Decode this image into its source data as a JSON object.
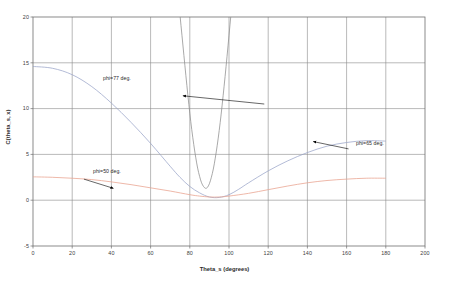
{
  "chart_data": {
    "type": "line",
    "title": "",
    "xlabel": "Theta_s (degrees)",
    "ylabel": "C(theta_s, x)",
    "xlim": [
      0,
      200
    ],
    "ylim": [
      -5,
      20
    ],
    "xticks": [
      0,
      20,
      40,
      60,
      80,
      100,
      120,
      140,
      160,
      180,
      200
    ],
    "yticks": [
      -5,
      0,
      5,
      10,
      15,
      20
    ],
    "grid": true,
    "legend": "annotations-inline",
    "series": [
      {
        "name": "phi=77 deg.",
        "color": "#8c8c8c",
        "x": [
          60,
          64,
          68,
          70,
          72,
          74,
          75,
          76,
          77,
          78,
          79,
          80,
          81,
          82,
          83,
          84,
          85,
          86,
          87,
          88,
          89,
          90,
          91,
          92,
          93,
          94,
          95,
          96,
          97,
          98,
          99,
          100,
          101,
          102,
          104,
          106,
          108
        ],
        "y": [
          52,
          44,
          36,
          31.5,
          27,
          22.5,
          20.2,
          18,
          15.8,
          13.6,
          11.5,
          9.5,
          7.7,
          6.1,
          4.7,
          3.5,
          2.6,
          1.9,
          1.5,
          1.3,
          1.4,
          1.8,
          2.5,
          3.4,
          4.6,
          6.0,
          7.6,
          9.4,
          11.4,
          13.5,
          15.7,
          18.0,
          20.3,
          22.7,
          27.6,
          32.7,
          38
        ]
      },
      {
        "name": "phi=65 deg.",
        "color": "#9aa4c8",
        "x": [
          0,
          10,
          20,
          30,
          40,
          50,
          60,
          70,
          75,
          80,
          85,
          90,
          95,
          100,
          105,
          110,
          120,
          130,
          140,
          150,
          160,
          170,
          180
        ],
        "y": [
          14.6,
          14.4,
          13.7,
          12.4,
          10.6,
          8.5,
          6.2,
          3.7,
          2.5,
          1.5,
          0.8,
          0.35,
          0.3,
          0.6,
          1.2,
          1.9,
          3.2,
          4.3,
          5.2,
          5.9,
          6.3,
          6.5,
          6.45
        ]
      },
      {
        "name": "phi=50 deg.",
        "color": "#e8a08c",
        "x": [
          0,
          10,
          20,
          30,
          40,
          50,
          60,
          70,
          80,
          85,
          90,
          95,
          100,
          110,
          120,
          130,
          140,
          150,
          160,
          170,
          180
        ],
        "y": [
          2.55,
          2.5,
          2.4,
          2.25,
          2.0,
          1.7,
          1.35,
          1.0,
          0.6,
          0.45,
          0.35,
          0.35,
          0.45,
          0.75,
          1.15,
          1.55,
          1.9,
          2.15,
          2.3,
          2.4,
          2.4
        ]
      }
    ],
    "annotations": [
      {
        "text": "phi=77 deg.",
        "arrow_from": [
          118,
          10.5
        ],
        "arrow_to": [
          76.5,
          11.4
        ]
      },
      {
        "text": "phi=50 deg.",
        "arrow_from": [
          26,
          2.3
        ],
        "arrow_to": [
          41,
          1.3
        ]
      },
      {
        "text": "phi=65 deg.",
        "arrow_from": [
          161,
          5.6
        ],
        "arrow_to": [
          143,
          6.4
        ]
      }
    ]
  },
  "axis": {
    "xlabel": "Theta_s (degrees)",
    "ylabel": "C(theta_s, x)",
    "xticks": [
      "0",
      "20",
      "40",
      "60",
      "80",
      "100",
      "120",
      "140",
      "160",
      "180",
      "200"
    ],
    "yticks": [
      "20",
      "15",
      "10",
      "5",
      "0",
      "-5"
    ]
  },
  "annotations": {
    "a0": "phi=77 deg.",
    "a1": "phi=50 deg.",
    "a2": "phi=65 deg."
  },
  "colors": {
    "grid": "#808080",
    "frame": "#707070",
    "series_77": "#8c8c8c",
    "series_65": "#9aa4c8",
    "series_50": "#e8a08c",
    "background": "#ffffff"
  }
}
